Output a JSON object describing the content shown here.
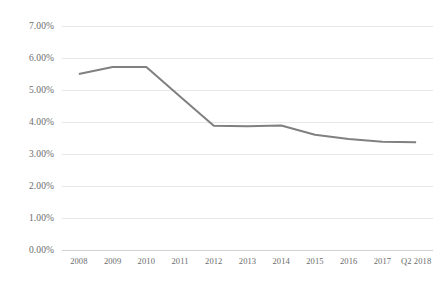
{
  "chart_data": {
    "type": "line",
    "title": "",
    "subtitle": "",
    "xlabel": "",
    "ylabel": "",
    "categories": [
      "2008",
      "2009",
      "2010",
      "2011",
      "2012",
      "2013",
      "2014",
      "2015",
      "2016",
      "2017",
      "Q2 2018"
    ],
    "series": [
      {
        "name": "Rate",
        "color": "#808080",
        "values": [
          5.5,
          5.72,
          5.72,
          4.8,
          3.88,
          3.87,
          3.89,
          3.6,
          3.47,
          3.38,
          3.37
        ]
      }
    ],
    "ylim": [
      0,
      7
    ],
    "ytick_step": 1,
    "ytick_labels": [
      "7.00%",
      "6.00%",
      "5.00%",
      "4.00%",
      "3.00%",
      "2.00%",
      "1.00%",
      "0.00%"
    ],
    "ytick_values": [
      7,
      6,
      5,
      4,
      3,
      2,
      1,
      0
    ],
    "value_format": "percent",
    "grid": true,
    "grid_axis": "y",
    "grid_color": "#e8e8e8",
    "axis_color": "#d2d2d2",
    "legend": false,
    "legend_position": "none",
    "background_color": "#ffffff",
    "tick_label_color": "#6b6b6b",
    "annotations": []
  }
}
